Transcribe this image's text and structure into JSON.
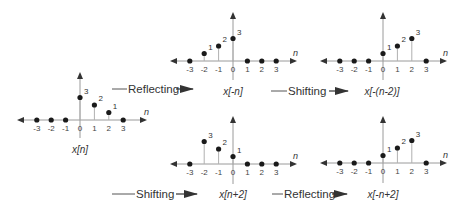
{
  "diagram": {
    "title": "",
    "axis_variable": "n",
    "tick_labels": [
      "-3",
      "-2",
      "-1",
      "0",
      "1",
      "2",
      "3"
    ],
    "plots": [
      {
        "id": "x_n",
        "label": "x[n]",
        "values": {
          "-3": 0,
          "-2": 0,
          "-1": 0,
          "0": 3,
          "1": 2,
          "2": 1,
          "3": 0
        }
      },
      {
        "id": "x_neg_n",
        "label": "x[-n]",
        "values": {
          "-3": 0,
          "-2": 1,
          "-1": 2,
          "0": 3,
          "1": 0,
          "2": 0,
          "3": 0
        }
      },
      {
        "id": "x_neg_n_minus_2",
        "label": "x[-(n-2)]",
        "values": {
          "-3": 0,
          "-2": 0,
          "-1": 0,
          "0": 1,
          "1": 2,
          "2": 3,
          "3": 0
        }
      },
      {
        "id": "x_n_plus_2",
        "label": "x[n+2]",
        "values": {
          "-3": 0,
          "-2": 3,
          "-1": 2,
          "0": 1,
          "1": 0,
          "2": 0,
          "3": 0
        }
      },
      {
        "id": "x_neg_n_plus_2",
        "label": "x[-n+2]",
        "values": {
          "-3": 0,
          "-2": 0,
          "-1": 0,
          "0": 1,
          "1": 2,
          "2": 3,
          "3": 0
        }
      }
    ],
    "operations": [
      {
        "id": "op1",
        "label": "Reflecting",
        "from": "x[n]",
        "to": "x[-n]"
      },
      {
        "id": "op2",
        "label": "Shifting",
        "from": "x[-n]",
        "to": "x[-(n-2)]"
      },
      {
        "id": "op3",
        "label": "Shifting",
        "from": "x[n]",
        "to": "x[n+2]"
      },
      {
        "id": "op4",
        "label": "Reflecting",
        "from": "x[n+2]",
        "to": "x[-n+2]"
      }
    ]
  }
}
